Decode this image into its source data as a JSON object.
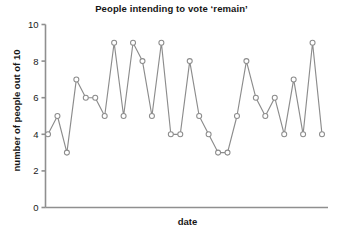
{
  "chart_data": {
    "type": "line",
    "title": "People intending to vote ‘remain’",
    "xlabel": "date",
    "ylabel": "number of people out of 10",
    "ylim": [
      0,
      10
    ],
    "yticks": [
      0,
      2,
      4,
      6,
      8,
      10
    ],
    "ytick_labels": [
      "0",
      "2",
      "4",
      "6",
      "8",
      "10"
    ],
    "xtick_labels": [],
    "grid": false,
    "legend": null,
    "marker": "open-circle",
    "line_color": "#8c8c8c",
    "marker_color": "#8c8c8c",
    "x": [
      1,
      2,
      3,
      4,
      5,
      6,
      7,
      8,
      9,
      10,
      11,
      12,
      13,
      14,
      15,
      16,
      17,
      18,
      19,
      20,
      21,
      22,
      23,
      24,
      25,
      26,
      27,
      28,
      29,
      30
    ],
    "values": [
      4,
      5,
      3,
      7,
      6,
      6,
      5,
      9,
      5,
      9,
      8,
      5,
      9,
      4,
      4,
      8,
      5,
      4,
      3,
      3,
      5,
      8,
      6,
      5,
      6,
      4,
      7,
      4,
      9,
      4
    ],
    "series": [
      {
        "name": "remain",
        "values": [
          4,
          5,
          3,
          7,
          6,
          6,
          5,
          9,
          5,
          9,
          8,
          5,
          9,
          4,
          4,
          8,
          5,
          4,
          3,
          3,
          5,
          8,
          6,
          5,
          6,
          4,
          7,
          4,
          9,
          4
        ]
      }
    ]
  }
}
